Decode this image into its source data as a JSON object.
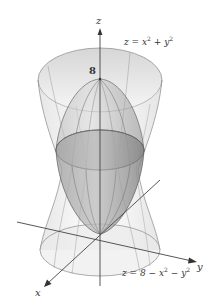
{
  "figure": {
    "type": "3d-surface-plot",
    "axes": {
      "x_label": "x",
      "y_label": "y",
      "z_label": "z"
    },
    "annotations": {
      "z_intercept": "8"
    },
    "surfaces": [
      {
        "name": "upper-paraboloid",
        "equation_lhs": "z = x",
        "exp1": "2",
        "mid": " + y",
        "exp2": "2",
        "description": "Upward-opening paraboloid (outer translucent surface)"
      },
      {
        "name": "lower-paraboloid",
        "equation_lhs": "z = 8 − x",
        "exp1": "2",
        "mid": " − y",
        "exp2": "2",
        "description": "Downward-opening paraboloid (inner shaded surface) with vertex at z = 8"
      }
    ],
    "colors": {
      "outer_surface_fill": "#e6e6e6",
      "inner_surface_fill": "#9a9a9a",
      "edge_lines": "#7a7a7a",
      "axis_lines": "#444444",
      "text": "#333333"
    }
  }
}
